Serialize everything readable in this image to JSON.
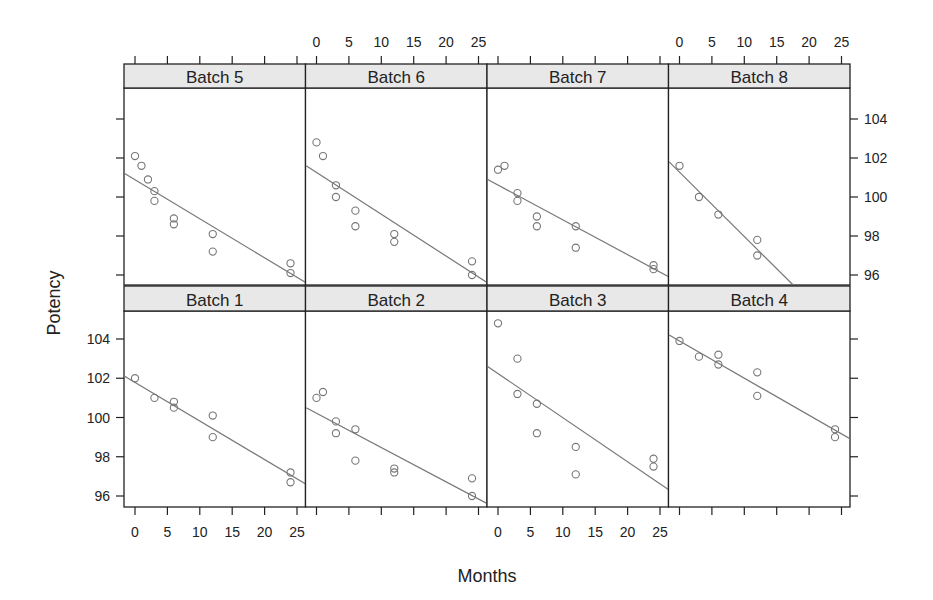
{
  "chart_data": {
    "type": "scatter",
    "layout": "lattice 4x2 panels with per-panel linear regression lines",
    "xlabel": "Months",
    "ylabel": "Potency",
    "xlim": [
      -2,
      26.5
    ],
    "ylim": [
      95.5,
      105.5
    ],
    "x_ticks": [
      0,
      5,
      10,
      15,
      20,
      25
    ],
    "y_ticks": [
      96,
      98,
      100,
      102,
      104
    ],
    "grid": false,
    "strip_color": "#e8e8e8",
    "point_color": "#777777",
    "line_color": "#777777",
    "panels": [
      {
        "name": "Batch 5",
        "row": 0,
        "col": 0,
        "points": [
          [
            0,
            102.1
          ],
          [
            1,
            101.6
          ],
          [
            2,
            100.9
          ],
          [
            3,
            100.3
          ],
          [
            3,
            99.8
          ],
          [
            6,
            98.9
          ],
          [
            6,
            98.6
          ],
          [
            12,
            98.1
          ],
          [
            12,
            97.2
          ],
          [
            24,
            96.6
          ],
          [
            24,
            96.1
          ]
        ],
        "line": [
          [
            -1.6,
            101.2
          ],
          [
            26.4,
            95.6
          ]
        ]
      },
      {
        "name": "Batch 6",
        "row": 0,
        "col": 1,
        "points": [
          [
            0,
            102.8
          ],
          [
            1,
            102.1
          ],
          [
            3,
            100.6
          ],
          [
            3,
            100.0
          ],
          [
            6,
            99.3
          ],
          [
            6,
            98.5
          ],
          [
            12,
            98.1
          ],
          [
            12,
            97.7
          ],
          [
            24,
            96.7
          ],
          [
            24,
            96.0
          ]
        ],
        "line": [
          [
            -1.6,
            101.6
          ],
          [
            26.4,
            95.6
          ]
        ]
      },
      {
        "name": "Batch 7",
        "row": 0,
        "col": 2,
        "points": [
          [
            0,
            101.4
          ],
          [
            1,
            101.6
          ],
          [
            3,
            100.2
          ],
          [
            3,
            99.8
          ],
          [
            6,
            99.0
          ],
          [
            6,
            98.5
          ],
          [
            12,
            98.5
          ],
          [
            12,
            97.4
          ],
          [
            24,
            96.5
          ],
          [
            24,
            96.3
          ]
        ],
        "line": [
          [
            -1.6,
            100.9
          ],
          [
            26.4,
            95.9
          ]
        ]
      },
      {
        "name": "Batch 8",
        "row": 0,
        "col": 3,
        "points": [
          [
            0,
            101.6
          ],
          [
            3,
            100.0
          ],
          [
            6,
            99.1
          ],
          [
            12,
            97.8
          ],
          [
            12,
            97.0
          ]
        ],
        "line": [
          [
            -1.6,
            101.8
          ],
          [
            17.5,
            95.5
          ]
        ]
      },
      {
        "name": "Batch 1",
        "row": 1,
        "col": 0,
        "points": [
          [
            0,
            102.0
          ],
          [
            3,
            101.0
          ],
          [
            6,
            100.8
          ],
          [
            6,
            100.5
          ],
          [
            12,
            100.1
          ],
          [
            12,
            99.0
          ],
          [
            24,
            97.2
          ],
          [
            24,
            96.7
          ]
        ],
        "line": [
          [
            -1.6,
            102.1
          ],
          [
            26.4,
            96.6
          ]
        ]
      },
      {
        "name": "Batch 2",
        "row": 1,
        "col": 1,
        "points": [
          [
            0,
            101.0
          ],
          [
            1,
            101.3
          ],
          [
            3,
            99.8
          ],
          [
            3,
            99.2
          ],
          [
            6,
            99.4
          ],
          [
            6,
            97.8
          ],
          [
            12,
            97.4
          ],
          [
            12,
            97.2
          ],
          [
            24,
            96.9
          ],
          [
            24,
            96.0
          ]
        ],
        "line": [
          [
            -1.6,
            100.5
          ],
          [
            26.4,
            95.6
          ]
        ]
      },
      {
        "name": "Batch 3",
        "row": 1,
        "col": 2,
        "points": [
          [
            0,
            104.8
          ],
          [
            3,
            103.0
          ],
          [
            3,
            101.2
          ],
          [
            6,
            100.7
          ],
          [
            6,
            99.2
          ],
          [
            12,
            98.5
          ],
          [
            12,
            97.1
          ],
          [
            24,
            97.9
          ],
          [
            24,
            97.5
          ]
        ],
        "line": [
          [
            -1.6,
            102.6
          ],
          [
            26.4,
            96.3
          ]
        ]
      },
      {
        "name": "Batch 4",
        "row": 1,
        "col": 3,
        "points": [
          [
            0,
            103.9
          ],
          [
            3,
            103.1
          ],
          [
            6,
            103.2
          ],
          [
            6,
            102.7
          ],
          [
            12,
            102.3
          ],
          [
            12,
            101.1
          ],
          [
            24,
            99.4
          ],
          [
            24,
            99.0
          ]
        ],
        "line": [
          [
            -1.6,
            104.2
          ],
          [
            26.4,
            98.9
          ]
        ]
      }
    ],
    "axes": {
      "top_x_labels_on_cols": [
        1,
        3
      ],
      "bottom_x_labels_on_cols": [
        0,
        2
      ],
      "left_y_labels_on_rows": [
        1
      ],
      "right_y_labels_on_rows": [
        0
      ]
    }
  }
}
